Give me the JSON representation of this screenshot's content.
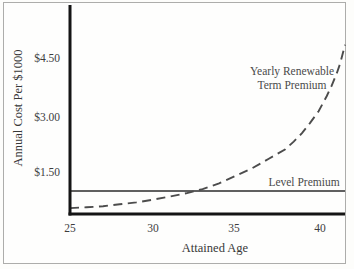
{
  "figure": {
    "background": "#fdfdfb",
    "frame_color": "#adadab",
    "axis_color": "#151515",
    "text_color": "#3d3d3d"
  },
  "chart_data": {
    "type": "line",
    "title": "",
    "xlabel": "Attained Age",
    "ylabel": "Annual Cost Per $1000",
    "x_ticks": [
      25,
      30,
      35,
      40
    ],
    "y_tick_labels": [
      "$1.50",
      "$3.00",
      "$4.50"
    ],
    "y_tick_values": [
      1.5,
      3.0,
      4.5
    ],
    "xlim": [
      25,
      41.6
    ],
    "ylim": [
      0,
      5.2
    ],
    "grid": false,
    "legend_position": "inline-annotations",
    "series": [
      {
        "name": "Yearly Renewable Term Premium",
        "style": "dashed",
        "color": "#4c4c4c",
        "points": [
          [
            25,
            0.55
          ],
          [
            26,
            0.57
          ],
          [
            27,
            0.6
          ],
          [
            28,
            0.65
          ],
          [
            29,
            0.7
          ],
          [
            30,
            0.77
          ],
          [
            31,
            0.85
          ],
          [
            32,
            0.94
          ],
          [
            33,
            1.05
          ],
          [
            34,
            1.2
          ],
          [
            35,
            1.4
          ],
          [
            36,
            1.6
          ],
          [
            37,
            1.85
          ],
          [
            38,
            2.1
          ],
          [
            38.5,
            2.3
          ],
          [
            39,
            2.52
          ],
          [
            39.5,
            2.8
          ],
          [
            40,
            3.1
          ],
          [
            40.5,
            3.5
          ],
          [
            40.8,
            3.78
          ],
          [
            41.1,
            4.1
          ],
          [
            41.3,
            4.35
          ],
          [
            41.6,
            4.85
          ]
        ]
      },
      {
        "name": "Level Premium",
        "style": "solid",
        "color": "#2b2b2b",
        "value": 1.0
      }
    ],
    "annotations": {
      "yrt_line1": "Yearly Renewable",
      "yrt_line2": "Term Premium",
      "level": "Level Premium"
    }
  }
}
